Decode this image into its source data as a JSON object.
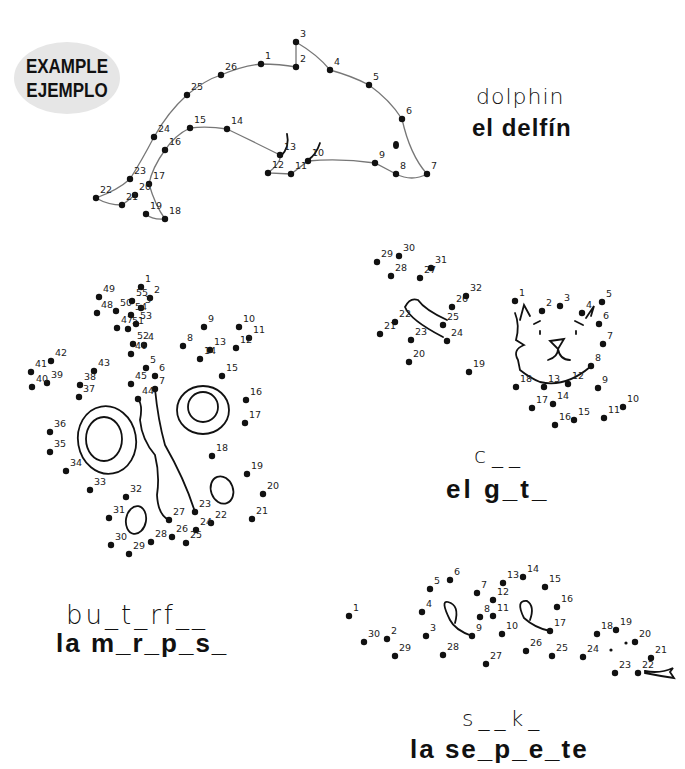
{
  "badge": {
    "line1": "EXAMPLE",
    "line2": "EJEMPLO",
    "bg_color": "#e6e6e6"
  },
  "puzzles": [
    {
      "id": "dolphin",
      "english": "dolphin",
      "spanish": "el delfín",
      "completed_example": true,
      "dots": [
        {
          "n": "1",
          "x": 261,
          "y": 64
        },
        {
          "n": "2",
          "x": 296,
          "y": 67
        },
        {
          "n": "3",
          "x": 296,
          "y": 42
        },
        {
          "n": "4",
          "x": 330,
          "y": 70
        },
        {
          "n": "5",
          "x": 369,
          "y": 85
        },
        {
          "n": "6",
          "x": 402,
          "y": 119
        },
        {
          "n": "7",
          "x": 427,
          "y": 174
        },
        {
          "n": "8",
          "x": 396,
          "y": 174
        },
        {
          "n": "9",
          "x": 375,
          "y": 163
        },
        {
          "n": "10",
          "x": 308,
          "y": 161
        },
        {
          "n": "11",
          "x": 291,
          "y": 174
        },
        {
          "n": "12",
          "x": 268,
          "y": 173
        },
        {
          "n": "13",
          "x": 280,
          "y": 155
        },
        {
          "n": "14",
          "x": 227,
          "y": 129
        },
        {
          "n": "15",
          "x": 190,
          "y": 128
        },
        {
          "n": "16",
          "x": 165,
          "y": 150
        },
        {
          "n": "17",
          "x": 149,
          "y": 184
        },
        {
          "n": "18",
          "x": 165,
          "y": 219
        },
        {
          "n": "19",
          "x": 146,
          "y": 214
        },
        {
          "n": "20",
          "x": 135,
          "y": 195
        },
        {
          "n": "21",
          "x": 122,
          "y": 205
        },
        {
          "n": "22",
          "x": 96,
          "y": 198
        },
        {
          "n": "23",
          "x": 130,
          "y": 179
        },
        {
          "n": "24",
          "x": 154,
          "y": 137
        },
        {
          "n": "25",
          "x": 187,
          "y": 95
        },
        {
          "n": "26",
          "x": 221,
          "y": 75
        }
      ]
    },
    {
      "id": "butterfly",
      "english": "bu_t_rf__",
      "spanish": "la m_r_p_s_",
      "dots": [
        {
          "n": "1",
          "x": 141,
          "y": 287
        },
        {
          "n": "2",
          "x": 150,
          "y": 298
        },
        {
          "n": "3",
          "x": 141,
          "y": 308
        },
        {
          "n": "4",
          "x": 144,
          "y": 345
        },
        {
          "n": "5",
          "x": 146,
          "y": 368
        },
        {
          "n": "6",
          "x": 155,
          "y": 376
        },
        {
          "n": "7",
          "x": 155,
          "y": 389
        },
        {
          "n": "8",
          "x": 183,
          "y": 346
        },
        {
          "n": "9",
          "x": 204,
          "y": 327
        },
        {
          "n": "10",
          "x": 239,
          "y": 327
        },
        {
          "n": "11",
          "x": 249,
          "y": 338
        },
        {
          "n": "12",
          "x": 236,
          "y": 348
        },
        {
          "n": "13",
          "x": 210,
          "y": 350
        },
        {
          "n": "14",
          "x": 200,
          "y": 359
        },
        {
          "n": "15",
          "x": 222,
          "y": 376
        },
        {
          "n": "16",
          "x": 246,
          "y": 400
        },
        {
          "n": "17",
          "x": 245,
          "y": 423
        },
        {
          "n": "18",
          "x": 212,
          "y": 456
        },
        {
          "n": "19",
          "x": 247,
          "y": 474
        },
        {
          "n": "20",
          "x": 263,
          "y": 494
        },
        {
          "n": "21",
          "x": 252,
          "y": 519
        },
        {
          "n": "22",
          "x": 211,
          "y": 523
        },
        {
          "n": "23",
          "x": 195,
          "y": 512
        },
        {
          "n": "24",
          "x": 196,
          "y": 530
        },
        {
          "n": "25",
          "x": 186,
          "y": 543
        },
        {
          "n": "26",
          "x": 172,
          "y": 537
        },
        {
          "n": "27",
          "x": 169,
          "y": 520
        },
        {
          "n": "28",
          "x": 151,
          "y": 542
        },
        {
          "n": "29",
          "x": 129,
          "y": 554
        },
        {
          "n": "30",
          "x": 111,
          "y": 545
        },
        {
          "n": "31",
          "x": 109,
          "y": 518
        },
        {
          "n": "32",
          "x": 126,
          "y": 497
        },
        {
          "n": "33",
          "x": 90,
          "y": 490
        },
        {
          "n": "34",
          "x": 66,
          "y": 471
        },
        {
          "n": "35",
          "x": 50,
          "y": 452
        },
        {
          "n": "36",
          "x": 50,
          "y": 432
        },
        {
          "n": "37",
          "x": 79,
          "y": 397
        },
        {
          "n": "38",
          "x": 80,
          "y": 385
        },
        {
          "n": "39",
          "x": 47,
          "y": 383
        },
        {
          "n": "40",
          "x": 32,
          "y": 387
        },
        {
          "n": "41",
          "x": 31,
          "y": 372
        },
        {
          "n": "42",
          "x": 51,
          "y": 361
        },
        {
          "n": "43",
          "x": 94,
          "y": 371
        },
        {
          "n": "44",
          "x": 138,
          "y": 399
        },
        {
          "n": "45",
          "x": 131,
          "y": 384
        },
        {
          "n": "46",
          "x": 131,
          "y": 354
        },
        {
          "n": "47",
          "x": 117,
          "y": 328
        },
        {
          "n": "48",
          "x": 97,
          "y": 313
        },
        {
          "n": "49",
          "x": 99,
          "y": 297
        },
        {
          "n": "50",
          "x": 116,
          "y": 311
        },
        {
          "n": "51",
          "x": 128,
          "y": 329
        },
        {
          "n": "52",
          "x": 133,
          "y": 344
        },
        {
          "n": "53",
          "x": 136,
          "y": 324
        },
        {
          "n": "54",
          "x": 131,
          "y": 315
        },
        {
          "n": "55",
          "x": 132,
          "y": 301
        }
      ]
    },
    {
      "id": "cat",
      "english": "c__",
      "spanish": "el g_t_",
      "dots": [
        {
          "n": "1",
          "x": 515,
          "y": 301
        },
        {
          "n": "2",
          "x": 542,
          "y": 311
        },
        {
          "n": "3",
          "x": 560,
          "y": 306
        },
        {
          "n": "4",
          "x": 582,
          "y": 313
        },
        {
          "n": "5",
          "x": 602,
          "y": 302
        },
        {
          "n": "6",
          "x": 599,
          "y": 324
        },
        {
          "n": "7",
          "x": 603,
          "y": 344
        },
        {
          "n": "8",
          "x": 591,
          "y": 366
        },
        {
          "n": "9",
          "x": 598,
          "y": 388
        },
        {
          "n": "10",
          "x": 623,
          "y": 407
        },
        {
          "n": "11",
          "x": 604,
          "y": 418
        },
        {
          "n": "12",
          "x": 568,
          "y": 384
        },
        {
          "n": "13",
          "x": 544,
          "y": 387
        },
        {
          "n": "14",
          "x": 553,
          "y": 404
        },
        {
          "n": "15",
          "x": 574,
          "y": 420
        },
        {
          "n": "16",
          "x": 555,
          "y": 425
        },
        {
          "n": "17",
          "x": 532,
          "y": 408
        },
        {
          "n": "18",
          "x": 516,
          "y": 387
        },
        {
          "n": "19",
          "x": 469,
          "y": 372
        },
        {
          "n": "20",
          "x": 409,
          "y": 362
        },
        {
          "n": "21",
          "x": 380,
          "y": 334
        },
        {
          "n": "22",
          "x": 395,
          "y": 322
        },
        {
          "n": "23",
          "x": 411,
          "y": 340
        },
        {
          "n": "24",
          "x": 447,
          "y": 341
        },
        {
          "n": "25",
          "x": 443,
          "y": 325
        },
        {
          "n": "26",
          "x": 452,
          "y": 307
        },
        {
          "n": "27",
          "x": 420,
          "y": 278
        },
        {
          "n": "28",
          "x": 391,
          "y": 276
        },
        {
          "n": "29",
          "x": 377,
          "y": 262
        },
        {
          "n": "30",
          "x": 399,
          "y": 256
        },
        {
          "n": "31",
          "x": 431,
          "y": 268
        },
        {
          "n": "32",
          "x": 466,
          "y": 296
        }
      ]
    },
    {
      "id": "snake",
      "english": "s__k_",
      "spanish": "la se_p_e_te",
      "dots": [
        {
          "n": "1",
          "x": 349,
          "y": 616
        },
        {
          "n": "2",
          "x": 387,
          "y": 639
        },
        {
          "n": "3",
          "x": 426,
          "y": 636
        },
        {
          "n": "4",
          "x": 422,
          "y": 612
        },
        {
          "n": "5",
          "x": 430,
          "y": 589
        },
        {
          "n": "6",
          "x": 450,
          "y": 580
        },
        {
          "n": "7",
          "x": 477,
          "y": 593
        },
        {
          "n": "8",
          "x": 480,
          "y": 617
        },
        {
          "n": "9",
          "x": 472,
          "y": 636
        },
        {
          "n": "10",
          "x": 502,
          "y": 634
        },
        {
          "n": "11",
          "x": 493,
          "y": 616
        },
        {
          "n": "12",
          "x": 493,
          "y": 600
        },
        {
          "n": "13",
          "x": 503,
          "y": 583
        },
        {
          "n": "14",
          "x": 523,
          "y": 577
        },
        {
          "n": "15",
          "x": 545,
          "y": 587
        },
        {
          "n": "16",
          "x": 557,
          "y": 607
        },
        {
          "n": "17",
          "x": 550,
          "y": 631
        },
        {
          "n": "18",
          "x": 597,
          "y": 634
        },
        {
          "n": "19",
          "x": 616,
          "y": 630
        },
        {
          "n": "20",
          "x": 635,
          "y": 642
        },
        {
          "n": "21",
          "x": 651,
          "y": 658
        },
        {
          "n": "22",
          "x": 638,
          "y": 673
        },
        {
          "n": "23",
          "x": 615,
          "y": 673
        },
        {
          "n": "24",
          "x": 583,
          "y": 657
        },
        {
          "n": "25",
          "x": 552,
          "y": 656
        },
        {
          "n": "26",
          "x": 526,
          "y": 651
        },
        {
          "n": "27",
          "x": 486,
          "y": 664
        },
        {
          "n": "28",
          "x": 443,
          "y": 655
        },
        {
          "n": "29",
          "x": 395,
          "y": 656
        },
        {
          "n": "30",
          "x": 364,
          "y": 642
        }
      ]
    }
  ]
}
